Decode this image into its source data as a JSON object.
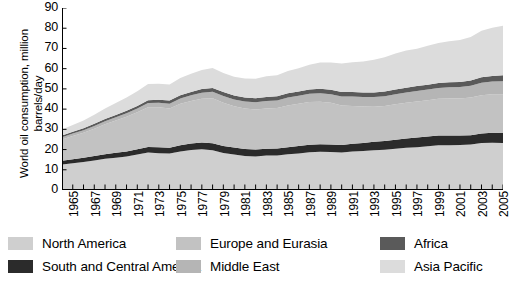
{
  "axes": {
    "y_title": "World oil consumption, million barrels/day",
    "y_ticks": [
      "90",
      "80",
      "70",
      "60",
      "50",
      "40",
      "30",
      "20",
      "10",
      "0"
    ],
    "x_ticks": [
      "1965",
      "1967",
      "1969",
      "1971",
      "1973",
      "1975",
      "1977",
      "1979",
      "1981",
      "1983",
      "1985",
      "1987",
      "1989",
      "1991",
      "1993",
      "1995",
      "1997",
      "1999",
      "2001",
      "2003",
      "2005"
    ]
  },
  "legend": {
    "items": [
      {
        "label": "North America",
        "color": "#cfcfcf"
      },
      {
        "label": "South and Central America",
        "color": "#2b2b2b"
      },
      {
        "label": "Europe and Eurasia",
        "color": "#c2c2c2"
      },
      {
        "label": "Middle East",
        "color": "#b5b5b5"
      },
      {
        "label": "Africa",
        "color": "#5a5a5a"
      },
      {
        "label": "Asia Pacific",
        "color": "#dcdcdc"
      }
    ]
  },
  "chart_data": {
    "type": "area",
    "title": "",
    "xlabel": "",
    "ylabel": "World oil consumption, million barrels/day",
    "ylim": [
      0,
      90
    ],
    "xlim": [
      1965,
      2006
    ],
    "grid": false,
    "legend_position": "bottom",
    "stacked": true,
    "x": [
      1965,
      1966,
      1967,
      1968,
      1969,
      1970,
      1971,
      1972,
      1973,
      1974,
      1975,
      1976,
      1977,
      1978,
      1979,
      1980,
      1981,
      1982,
      1983,
      1984,
      1985,
      1986,
      1987,
      1988,
      1989,
      1990,
      1991,
      1992,
      1993,
      1994,
      1995,
      1996,
      1997,
      1998,
      1999,
      2000,
      2001,
      2002,
      2003,
      2004,
      2005,
      2006
    ],
    "series": [
      {
        "name": "North America",
        "color": "#cfcfcf",
        "values": [
          12.6,
          13.2,
          13.8,
          14.6,
          15.4,
          16.0,
          16.6,
          17.6,
          18.5,
          18.2,
          18.0,
          19.0,
          19.8,
          20.1,
          19.6,
          18.3,
          17.6,
          16.8,
          16.6,
          17.0,
          17.1,
          17.7,
          18.1,
          18.7,
          18.9,
          18.8,
          18.5,
          19.0,
          19.3,
          19.7,
          19.9,
          20.4,
          20.9,
          21.2,
          21.6,
          22.1,
          22.1,
          22.2,
          22.5,
          23.2,
          23.4,
          23.2
        ]
      },
      {
        "name": "South and Central America",
        "color": "#2b2b2b",
        "values": [
          1.9,
          2.0,
          2.1,
          2.2,
          2.3,
          2.4,
          2.5,
          2.6,
          2.8,
          2.9,
          2.9,
          3.1,
          3.2,
          3.4,
          3.5,
          3.5,
          3.4,
          3.5,
          3.4,
          3.4,
          3.4,
          3.5,
          3.6,
          3.7,
          3.7,
          3.7,
          3.8,
          3.9,
          4.0,
          4.1,
          4.3,
          4.4,
          4.6,
          4.8,
          4.8,
          4.8,
          4.8,
          4.7,
          4.6,
          4.8,
          4.9,
          5.0
        ]
      },
      {
        "name": "Europe and Eurasia",
        "color": "#c2c2c2",
        "values": [
          10.5,
          11.5,
          12.4,
          13.5,
          14.8,
          16.0,
          17.1,
          18.2,
          19.6,
          19.8,
          19.4,
          20.5,
          21.0,
          21.6,
          22.3,
          21.4,
          20.4,
          20.0,
          19.8,
          19.9,
          20.0,
          20.6,
          20.9,
          21.1,
          21.1,
          20.6,
          19.5,
          18.7,
          18.0,
          17.4,
          17.3,
          17.6,
          17.6,
          17.8,
          18.0,
          18.2,
          18.4,
          18.4,
          18.6,
          18.9,
          19.0,
          19.2
        ]
      },
      {
        "name": "Middle East",
        "color": "#b5b5b5",
        "values": [
          1.1,
          1.2,
          1.3,
          1.4,
          1.5,
          1.6,
          1.8,
          1.9,
          2.1,
          2.2,
          2.3,
          2.6,
          2.8,
          3.0,
          3.2,
          3.3,
          3.4,
          3.5,
          3.6,
          3.7,
          3.8,
          3.9,
          4.0,
          4.1,
          4.2,
          4.3,
          4.4,
          4.6,
          4.7,
          4.8,
          4.9,
          5.0,
          5.1,
          5.2,
          5.3,
          5.4,
          5.5,
          5.6,
          5.8,
          6.1,
          6.3,
          6.4
        ]
      },
      {
        "name": "Africa",
        "color": "#5a5a5a",
        "values": [
          0.8,
          0.9,
          0.9,
          1.0,
          1.1,
          1.1,
          1.2,
          1.3,
          1.4,
          1.5,
          1.6,
          1.6,
          1.7,
          1.8,
          1.9,
          1.9,
          1.9,
          2.0,
          2.0,
          2.0,
          2.0,
          2.1,
          2.1,
          2.1,
          2.2,
          2.2,
          2.2,
          2.2,
          2.2,
          2.2,
          2.3,
          2.3,
          2.4,
          2.4,
          2.4,
          2.4,
          2.5,
          2.5,
          2.6,
          2.7,
          2.8,
          2.9
        ]
      },
      {
        "name": "Asia Pacific",
        "color": "#dcdcdc",
        "values": [
          3.0,
          3.4,
          3.9,
          4.5,
          5.2,
          5.9,
          6.5,
          7.2,
          8.0,
          8.0,
          8.0,
          8.6,
          9.0,
          9.4,
          9.8,
          9.5,
          9.3,
          9.3,
          9.6,
          10.2,
          10.5,
          11.0,
          11.5,
          12.2,
          12.9,
          13.5,
          14.1,
          14.8,
          15.4,
          16.2,
          17.0,
          17.8,
          18.4,
          18.4,
          19.2,
          19.8,
          20.2,
          20.8,
          21.6,
          23.0,
          23.8,
          24.5
        ]
      }
    ]
  }
}
